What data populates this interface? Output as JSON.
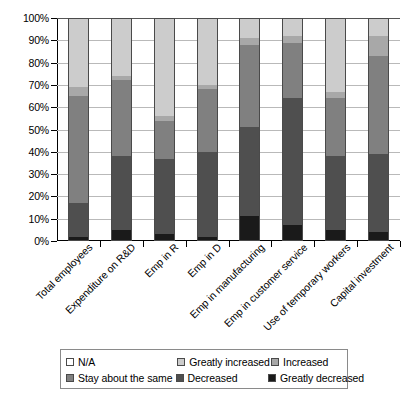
{
  "chart_data": {
    "type": "bar",
    "subtype": "stacked-percentage-bar",
    "title": "",
    "xlabel": "",
    "ylabel": "",
    "ylim": [
      0,
      100
    ],
    "grid": true,
    "legend_position": "bottom",
    "y_ticks": [
      "0%",
      "10%",
      "20%",
      "30%",
      "40%",
      "50%",
      "60%",
      "70%",
      "80%",
      "90%",
      "100%"
    ],
    "y_tick_values": [
      0,
      10,
      20,
      30,
      40,
      50,
      60,
      70,
      80,
      90,
      100
    ],
    "categories": [
      "Total employees",
      "Expenditure on R&D",
      "Emp in R",
      "Emp in D",
      "Emp in manufacturing",
      "Emp in customer service",
      "Use of temporary workers",
      "Capital investment"
    ],
    "series": [
      {
        "name": "Greatly decreased",
        "color": "#1a1a1a",
        "values": [
          2,
          5,
          3,
          2,
          11,
          7,
          5,
          4
        ]
      },
      {
        "name": "Decreased",
        "color": "#4f4f4f",
        "values": [
          15,
          33,
          34,
          38,
          40,
          57,
          33,
          35
        ]
      },
      {
        "name": "Stay about the same",
        "color": "#808080",
        "values": [
          48,
          34,
          17,
          28,
          37,
          25,
          26,
          44
        ]
      },
      {
        "name": "Increased",
        "color": "#a8a8a8",
        "values": [
          4,
          2,
          2,
          2,
          3,
          3,
          3,
          9
        ]
      },
      {
        "name": "Greatly increased",
        "color": "#cccccc",
        "values": [
          31,
          26,
          44,
          30,
          9,
          8,
          33,
          8
        ]
      },
      {
        "name": "N/A",
        "color": "#ffffff",
        "values": [
          0,
          0,
          0,
          0,
          0,
          0,
          0,
          0
        ]
      }
    ]
  },
  "legend": {
    "items": [
      {
        "label": "N/A",
        "color": "#ffffff"
      },
      {
        "label": "Greatly increased",
        "color": "#cccccc"
      },
      {
        "label": "Increased",
        "color": "#a8a8a8"
      },
      {
        "label": "Stay about the same",
        "color": "#808080"
      },
      {
        "label": "Decreased",
        "color": "#4f4f4f"
      },
      {
        "label": "Greatly decreased",
        "color": "#1a1a1a"
      }
    ]
  },
  "colors": {
    "axis": "#000000",
    "gridline": "#b9b9b9",
    "bar_border": "#4a4a4a",
    "background": "#ffffff"
  }
}
